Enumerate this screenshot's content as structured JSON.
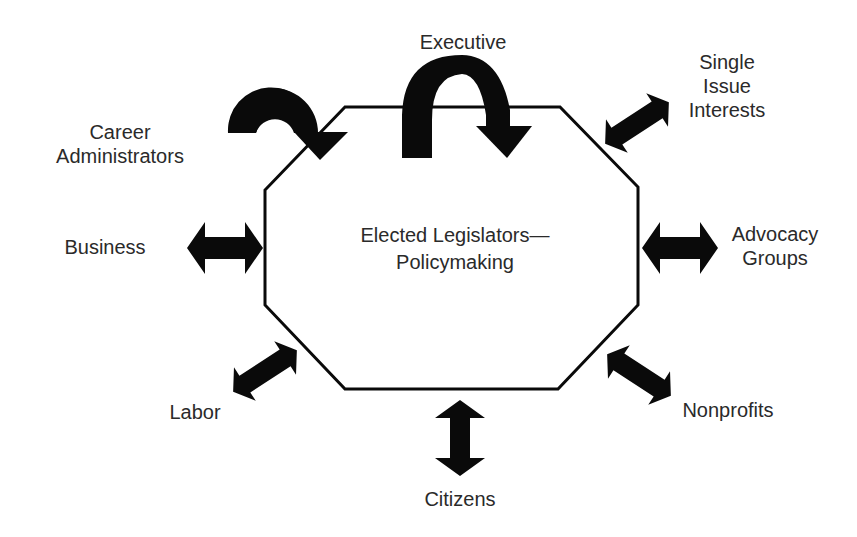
{
  "diagram": {
    "center": {
      "line1": "Elected Legislators—",
      "line2": "Policymaking"
    },
    "actors": {
      "executive": {
        "label": "Executive",
        "relation": "one-way-curved"
      },
      "career_administrators": {
        "line1": "Career",
        "line2": "Administrators",
        "relation": "one-way-curved"
      },
      "single_issue_interests": {
        "line1": "Single",
        "line2": "Issue",
        "line3": "Interests",
        "relation": "two-way"
      },
      "business": {
        "label": "Business",
        "relation": "two-way"
      },
      "advocacy_groups": {
        "line1": "Advocacy",
        "line2": "Groups",
        "relation": "two-way"
      },
      "labor": {
        "label": "Labor",
        "relation": "two-way"
      },
      "nonprofits": {
        "label": "Nonprofits",
        "relation": "two-way"
      },
      "citizens": {
        "label": "Citizens",
        "relation": "two-way"
      }
    },
    "shape": "octagon",
    "colors": {
      "arrow": "#0a0a0a",
      "outline": "#0a0a0a",
      "text": "#2a2a2a",
      "background": "#ffffff"
    }
  }
}
